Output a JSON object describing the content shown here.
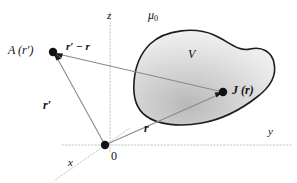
{
  "figure": {
    "background": "#ffffff",
    "width": 297,
    "height": 183
  },
  "labels": {
    "field_point": "A (r′)",
    "separation_vector": "r′ − r",
    "source_to_field": "r′",
    "permeability": "μ",
    "permeability_sub": "0",
    "axis_z": "z",
    "axis_y": "y",
    "axis_x": "x",
    "origin": "0",
    "volume": "V",
    "current_density": "J (r)",
    "position_vector": "r"
  },
  "icons": {
    "field_point_dot": "filled-circle-icon",
    "source_point_dot": "filled-circle-icon",
    "origin_dot": "filled-circle-icon",
    "arrowhead": "arrowhead-icon"
  },
  "colors": {
    "line": "#7b7b7b",
    "axis": "#c8c8c8",
    "outline": "#1a1a1a",
    "blob_light": "#fbfbfb",
    "blob_dark": "#c9c9c9",
    "dot": "#111111",
    "text": "#111111"
  },
  "geometry": {
    "origin": {
      "x": 105,
      "y": 145
    },
    "field_point": {
      "x": 53,
      "y": 52
    },
    "source_point": {
      "x": 223,
      "y": 92
    },
    "z_axis": {
      "x": 110,
      "y_top": 12,
      "y_bottom": 150
    },
    "y_axis": {
      "y": 145,
      "x_left": 62,
      "x_right": 292
    },
    "x_axis": {
      "from": {
        "x": 105,
        "y": 145
      },
      "to": {
        "x": 60,
        "y": 176
      }
    }
  }
}
